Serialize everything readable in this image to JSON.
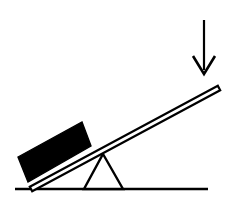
{
  "figure": {
    "title": "Lever with fulcrum, load block and applied downward force",
    "type": "line-diagram",
    "background_color": "#ffffff",
    "ink_color": "#000000",
    "canvas": {
      "width": 235,
      "height": 212
    }
  },
  "elements": {
    "ground": {
      "name": "ground line",
      "x1": 15,
      "y1": 189,
      "x2": 208,
      "y2": 189,
      "stroke_width": 2.4,
      "color": "#000000"
    },
    "fulcrum": {
      "name": "triangular fulcrum",
      "apex_x": 103,
      "apex_y": 154,
      "base_left_x": 84,
      "base_right_x": 123,
      "base_y": 189,
      "stroke_width": 2.4,
      "fill": "#ffffff",
      "color": "#000000"
    },
    "lever": {
      "name": "lever plank",
      "left_tip_x": 31,
      "left_tip_y": 189,
      "right_tip_x": 219,
      "right_tip_y": 88,
      "thickness": 5,
      "fill": "#ffffff",
      "color": "#000000",
      "stroke_width": 2.2
    },
    "block": {
      "name": "load block",
      "fill": "#000000",
      "corners": [
        {
          "x": 18,
          "y": 157
        },
        {
          "x": 82,
          "y": 122
        },
        {
          "x": 91,
          "y": 146
        },
        {
          "x": 28,
          "y": 182
        }
      ]
    },
    "force_arrow": {
      "name": "downward force arrow",
      "shaft_x": 204,
      "shaft_top_y": 20,
      "shaft_bottom_y": 70,
      "tip_x": 204,
      "tip_y": 74,
      "head_left_x": 193,
      "head_right_x": 215,
      "head_top_y": 56,
      "shaft_width": 2.2,
      "head_width": 2.6,
      "color": "#000000",
      "direction": "down"
    }
  },
  "labels": {
    "figure_caption": ""
  }
}
